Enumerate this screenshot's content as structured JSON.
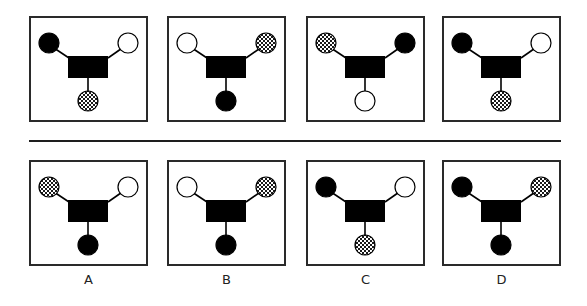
{
  "figure": {
    "colors": {
      "black": "#000000",
      "white": "#ffffff",
      "border": "#2a2a2a",
      "checker_dark": "#1a1a1a",
      "checker_light": "#ffffff"
    }
  },
  "top_row": [
    {
      "id": "t1",
      "left": "black",
      "right": "white",
      "bottom": "checker"
    },
    {
      "id": "t2",
      "left": "white",
      "right": "checker",
      "bottom": "black"
    },
    {
      "id": "t3",
      "left": "checker",
      "right": "black",
      "bottom": "white"
    },
    {
      "id": "t4",
      "left": "black",
      "right": "white",
      "bottom": "checker"
    }
  ],
  "options": [
    {
      "label": "A",
      "left": "checker",
      "right": "white",
      "bottom": "black"
    },
    {
      "label": "B",
      "left": "white",
      "right": "checker",
      "bottom": "black"
    },
    {
      "label": "C",
      "left": "black",
      "right": "white",
      "bottom": "checker"
    },
    {
      "label": "D",
      "left": "black",
      "right": "checker",
      "bottom": "black"
    }
  ]
}
